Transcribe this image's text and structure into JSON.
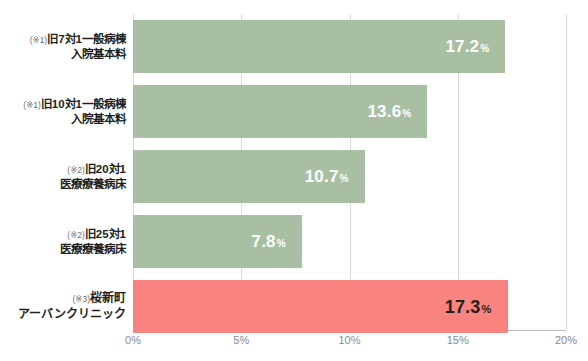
{
  "top_cropped_text": {
    "left": "",
    "right": ""
  },
  "chart_data": {
    "type": "bar",
    "orientation": "horizontal",
    "title": "",
    "xlabel": "",
    "ylabel": "",
    "xlim": [
      0,
      20
    ],
    "grid": true,
    "legend": "none",
    "tick_labels": [
      "0%",
      "5%",
      "10%",
      "15%",
      "20%"
    ],
    "tick_values": [
      0,
      5,
      10,
      15,
      20
    ],
    "categories": [
      "(※1)旧7対1一般病棟入院基本料",
      "(※1)旧10対1一般病棟入院基本料",
      "(※2)旧20対1医療療養病床",
      "(※2)旧25対1医療療養病床",
      "(※3)桜新町アーバンクリニック"
    ],
    "values": [
      17.2,
      13.6,
      10.7,
      7.8,
      17.3
    ],
    "value_labels": [
      "17.2",
      "13.6",
      "10.7",
      "7.8",
      "17.3"
    ],
    "unit": "%",
    "bars": [
      {
        "note": "(※1)",
        "line1": "旧7対1一般病棟",
        "line2": "入院基本料",
        "value": 17.2,
        "value_label": "17.2",
        "unit": "%",
        "highlight": false,
        "color": "#a9bfa3",
        "label_color": "#ffffff"
      },
      {
        "note": "(※1)",
        "line1": "旧10対1一般病棟",
        "line2": "入院基本料",
        "value": 13.6,
        "value_label": "13.6",
        "unit": "%",
        "highlight": false,
        "color": "#a9bfa3",
        "label_color": "#ffffff"
      },
      {
        "note": "(※2)",
        "line1": "旧20対1",
        "line2": "医療療養病床",
        "value": 10.7,
        "value_label": "10.7",
        "unit": "%",
        "highlight": false,
        "color": "#a9bfa3",
        "label_color": "#ffffff"
      },
      {
        "note": "(※2)",
        "line1": "旧25対1",
        "line2": "医療療養病床",
        "value": 7.8,
        "value_label": "7.8",
        "unit": "%",
        "highlight": false,
        "color": "#a9bfa3",
        "label_color": "#ffffff"
      },
      {
        "note": "(※3)",
        "line1": "桜新町",
        "line2": "アーバンクリニック",
        "value": 17.3,
        "value_label": "17.3",
        "unit": "%",
        "highlight": true,
        "color": "#f9837e",
        "label_color": "#231f20"
      }
    ]
  },
  "colors": {
    "bar_default": "#a9bfa3",
    "bar_highlight": "#f9837e",
    "gridline": "#d8d8dc",
    "baseline": "#b9b9bf",
    "tick_text": "#8a8a90",
    "category_text": "#231f20"
  }
}
